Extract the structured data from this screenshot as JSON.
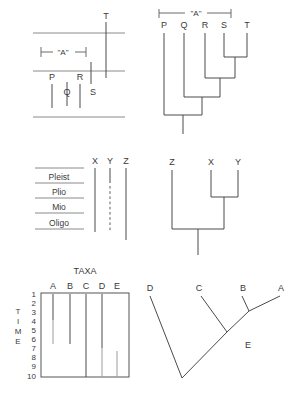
{
  "figure": {
    "background_color": "#ffffff",
    "line_color": "#4a4a4a",
    "text_color": "#3a3a3a",
    "width": 292,
    "height": 413
  },
  "panel_a": {
    "name": "stratigraphic-ranges-PQRST",
    "bracket_label": "\"A\"",
    "taxa": [
      {
        "label": "P",
        "x": 52,
        "label_y": 78,
        "top": 84,
        "bottom": 108
      },
      {
        "label": "Q",
        "x": 67,
        "label_y": 92,
        "top": 82,
        "bottom": 106
      },
      {
        "label": "R",
        "x": 80,
        "label_y": 78,
        "top": 84,
        "bottom": 108
      },
      {
        "label": "S",
        "x": 91,
        "label_y": 92,
        "top": 62,
        "bottom": 84
      },
      {
        "label": "T",
        "x": 106,
        "label_y": 27,
        "top": 32,
        "bottom": 72
      }
    ],
    "horizon_lines": [
      {
        "y": 33,
        "x1": 33,
        "x2": 125
      },
      {
        "y": 71,
        "x1": 33,
        "x2": 125
      },
      {
        "y": 117,
        "x1": 33,
        "x2": 125
      }
    ],
    "bracket": {
      "y": 52,
      "x1": 41,
      "x2": 86,
      "text_x": 63,
      "text_y": 50
    }
  },
  "panel_b": {
    "name": "cladogram-PQRST",
    "bracket_label": "\"A\"",
    "tips": [
      {
        "label": "P",
        "x": 164,
        "label_y": 25
      },
      {
        "label": "Q",
        "x": 184,
        "label_y": 25
      },
      {
        "label": "R",
        "x": 205,
        "label_y": 25
      },
      {
        "label": "S",
        "x": 224,
        "label_y": 25
      },
      {
        "label": "T",
        "x": 247,
        "label_y": 25
      }
    ],
    "bracket": {
      "y": 13,
      "x1": 159,
      "x2": 231,
      "text_x": 195,
      "text_y": 11
    },
    "nodes": [
      {
        "name": "S-T",
        "y": 57,
        "x1": 224,
        "x2": 247,
        "stem_x": 235
      },
      {
        "name": "R-ST",
        "y": 78,
        "x1": 205,
        "x2": 235,
        "stem_x": 220
      },
      {
        "name": "Q-RST",
        "y": 97,
        "x1": 184,
        "x2": 220,
        "stem_x": 202
      },
      {
        "name": "P-QRST",
        "y": 115,
        "x1": 164,
        "x2": 202,
        "stem_x": 183
      }
    ],
    "root": {
      "x": 183,
      "y1": 115,
      "y2": 134
    },
    "tip_line_top": 30
  },
  "panel_c": {
    "name": "epoch-ranges-XYZ",
    "epochs": [
      {
        "label": "Pleist",
        "y_top": 168,
        "y_bottom": 183
      },
      {
        "label": "Plio",
        "y_top": 183,
        "y_bottom": 198
      },
      {
        "label": "Mio",
        "y_top": 198,
        "y_bottom": 213
      },
      {
        "label": "Oligo",
        "y_top": 213,
        "y_bottom": 229
      }
    ],
    "epoch_box": {
      "x1": 35,
      "x2": 84,
      "label_x": 59
    },
    "taxa": [
      {
        "label": "X",
        "x": 95,
        "label_y": 162,
        "top": 168,
        "bottom": 232,
        "style": "solid"
      },
      {
        "label": "Y",
        "x": 110,
        "label_y": 162,
        "top": 168,
        "bottom": 232,
        "style": "dashed"
      },
      {
        "label": "Z",
        "x": 126,
        "label_y": 162,
        "top": 168,
        "bottom": 240,
        "style": "solid"
      }
    ]
  },
  "panel_d": {
    "name": "cladogram-ZXY",
    "tips": [
      {
        "label": "Z",
        "x": 172,
        "label_y": 162
      },
      {
        "label": "X",
        "x": 211,
        "label_y": 162
      },
      {
        "label": "Y",
        "x": 238,
        "label_y": 162
      }
    ],
    "nodes": [
      {
        "name": "X-Y",
        "y": 197,
        "x1": 211,
        "x2": 238,
        "stem_x": 224
      },
      {
        "name": "Z-XY",
        "y": 229,
        "x1": 172,
        "x2": 224,
        "stem_x": 198
      }
    ],
    "root": {
      "x": 198,
      "y1": 229,
      "y2": 252
    },
    "tip_line_top": 168
  },
  "panel_e": {
    "name": "taxa-time-range-chart",
    "title": "TAXA",
    "axis_label": "TIME",
    "axis_label_letters": [
      "T",
      "I",
      "M",
      "E"
    ],
    "time_ticks": [
      1,
      2,
      3,
      4,
      5,
      6,
      7,
      8,
      9,
      10
    ],
    "plot_box": {
      "x1": 41,
      "y1": 293,
      "x2": 129,
      "y2": 377
    },
    "columns": [
      {
        "label": "A",
        "x": 53,
        "label_y": 287,
        "first": 1,
        "last": 6,
        "fade_from": 4,
        "weight": "normal"
      },
      {
        "label": "B",
        "x": 70,
        "label_y": 287,
        "first": 1,
        "last": 6,
        "fade_from": null,
        "weight": "normal"
      },
      {
        "label": "C",
        "x": 86,
        "label_y": 287,
        "first": 1,
        "last": 10,
        "fade_from": null,
        "weight": "bold"
      },
      {
        "label": "D",
        "x": 102,
        "label_y": 287,
        "first": 1,
        "last": 10,
        "fade_from": 7,
        "weight": "normal"
      },
      {
        "label": "E",
        "x": 117,
        "label_y": 287,
        "first": 7.3,
        "last": 10,
        "fade_from": null,
        "weight": "normal"
      }
    ]
  },
  "panel_f": {
    "name": "diagonal-phylogeny-ABCDE",
    "tips": [
      {
        "label": "D",
        "x": 152,
        "label_y": 288
      },
      {
        "label": "C",
        "x": 199,
        "label_y": 288
      },
      {
        "label": "B",
        "x": 243,
        "label_y": 288
      },
      {
        "label": "A",
        "x": 281,
        "label_y": 288
      }
    ],
    "internal_nodes": [
      {
        "label": "E",
        "x": 240,
        "y": 342,
        "label_x": 246,
        "label_y": 348
      }
    ],
    "segments": [
      {
        "name": "root-to-D",
        "x1": 182,
        "y1": 378,
        "x2": 150,
        "y2": 294
      },
      {
        "name": "root-to-node1",
        "x1": 182,
        "y1": 378,
        "x2": 227,
        "y2": 332
      },
      {
        "name": "node1-to-C",
        "x1": 227,
        "y1": 332,
        "x2": 200,
        "y2": 294
      },
      {
        "name": "node1-to-E",
        "x1": 227,
        "y1": 332,
        "x2": 249,
        "y2": 311
      },
      {
        "name": "E-to-B",
        "x1": 249,
        "y1": 311,
        "x2": 241,
        "y2": 294
      },
      {
        "name": "E-to-A",
        "x1": 249,
        "y1": 311,
        "x2": 280,
        "y2": 294
      }
    ]
  }
}
